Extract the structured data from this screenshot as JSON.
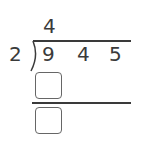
{
  "problem": {
    "divisor": "2",
    "dividend": [
      "9",
      "4",
      "5"
    ],
    "quotient": [
      "4"
    ],
    "answer_boxes": [
      {
        "value": ""
      },
      {
        "value": ""
      }
    ]
  },
  "colors": {
    "ink": "#3a3a3a",
    "box_border": "#666666",
    "background": "#ffffff"
  }
}
